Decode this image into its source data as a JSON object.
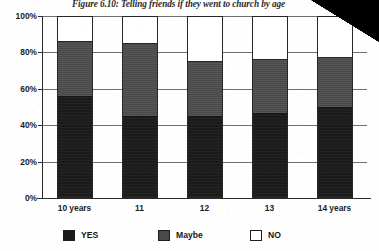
{
  "figure": {
    "title": "Figure 6.10: Telling friends if they went to church by age",
    "title_truncated": true
  },
  "axes": {
    "ylabel": "",
    "xlabel": "",
    "y_ticks": [
      "0%",
      "20%",
      "40%",
      "60%",
      "80%",
      "100%"
    ],
    "y_tick_values": [
      0,
      20,
      40,
      60,
      80,
      100
    ],
    "x_ticks": [
      "10 years",
      "11",
      "12",
      "13",
      "14 years"
    ]
  },
  "legend": {
    "position": "bottom",
    "items": [
      {
        "label": "YES",
        "color": "#1b1b1b"
      },
      {
        "label": "Maybe",
        "color": "#494949"
      },
      {
        "label": "NO",
        "color": "#ffffff"
      }
    ]
  },
  "colors": {
    "yes": "#1b1b1b",
    "maybe": "#494949",
    "no": "#ffffff",
    "axis": "#2a2a2a",
    "gridline": "#6f6f6f"
  },
  "chart_data": {
    "type": "bar",
    "stacked": true,
    "title": "Figure 6.10: Telling friends if they went to church by age",
    "xlabel": "",
    "ylabel": "",
    "ylim": [
      0,
      100
    ],
    "grid": true,
    "legend_position": "bottom",
    "categories": [
      "10 years",
      "11",
      "12",
      "13",
      "14 years"
    ],
    "series": [
      {
        "name": "YES",
        "values": [
          55.5,
          44.5,
          44.5,
          46.0,
          49.5
        ]
      },
      {
        "name": "Maybe",
        "values": [
          30.5,
          40.5,
          30.5,
          30.0,
          27.5
        ]
      },
      {
        "name": "NO",
        "values": [
          14.0,
          15.0,
          25.0,
          24.0,
          23.0
        ]
      }
    ],
    "cumulative_tops": {
      "yes": [
        55.5,
        44.5,
        44.5,
        46.0,
        49.5
      ],
      "maybe": [
        86.0,
        85.0,
        75.0,
        76.0,
        77.0
      ],
      "no": [
        100.0,
        100.0,
        100.0,
        100.0,
        100.0
      ]
    }
  }
}
